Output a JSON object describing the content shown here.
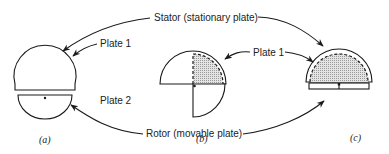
{
  "labels": {
    "stator": "Stator (stationary plate)",
    "plate1_a": "Plate 1",
    "plate2_a": "Plate 2",
    "plate1_bc": "Plate 1",
    "rotor": "Rotor (movable plate)"
  },
  "captions": {
    "a": "(a)",
    "b": "(b)",
    "c": "(c)"
  },
  "colors": {
    "line": "#1a1a1a",
    "shade": "#d8d8d8",
    "background": "#ffffff"
  }
}
